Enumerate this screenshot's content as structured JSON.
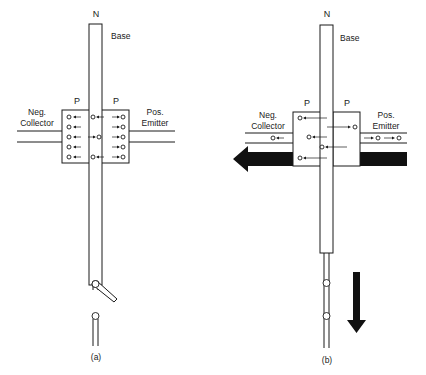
{
  "figure": {
    "panel_a": {
      "caption": "(a)",
      "base_type": "N",
      "base_label": "Base",
      "left_region": "P",
      "right_region": "P",
      "collector_label_line1": "Neg.",
      "collector_label_line2": "Collector",
      "emitter_label_line1": "Pos.",
      "emitter_label_line2": "Emitter",
      "switch_state": "open",
      "current_flow": "none"
    },
    "panel_b": {
      "caption": "(b)",
      "base_type": "N",
      "base_label": "Base",
      "left_region": "P",
      "right_region": "P",
      "collector_label_line1": "Neg.",
      "collector_label_line2": "Collector",
      "emitter_label_line1": "Pos.",
      "emitter_label_line2": "Emitter",
      "switch_state": "closed",
      "current_flow": "large current emitter to collector (leftward arrow), base current downward"
    },
    "colors": {
      "ink": "#1a1a1a",
      "background": "#ffffff",
      "current_arrow": "#111111"
    }
  }
}
